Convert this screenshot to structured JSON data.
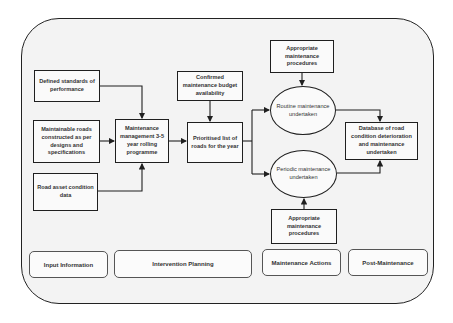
{
  "diagram": {
    "inputs": [
      {
        "id": "standards",
        "label": "Defined standards of performance"
      },
      {
        "id": "maintainable",
        "label": "Maintainable roads constructed as per designs and specifications"
      },
      {
        "id": "asset",
        "label": "Road asset condition data"
      }
    ],
    "planning": {
      "management": "Maintenance management 3-5 year rolling programme",
      "budget": "Confirmed maintenance budget availability",
      "prioritised": "Prioritised list of roads for the year"
    },
    "actions": {
      "procedures_top": "Appropriate maintenance procedures",
      "routine": "Routine maintenance undertaken",
      "periodic": "Periodic maintenance undertaken",
      "procedures_bottom": "Appropriate maintenance procedures"
    },
    "post": {
      "database": "Database of road condition deterioration and maintenance undertaken"
    },
    "stages": [
      {
        "label": "Input Information"
      },
      {
        "label": "Intervention Planning"
      },
      {
        "label": "Maintenance Actions"
      },
      {
        "label": "Post-Maintenance"
      }
    ],
    "colors": {
      "line": "#1f1f1f",
      "background": "#f3f3f3"
    }
  }
}
